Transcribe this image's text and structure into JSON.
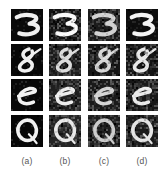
{
  "figure": {
    "kind": "image-grid",
    "rows": 4,
    "columns": 4,
    "background_color": "#ffffff",
    "patch_background_color": "#050505",
    "patch_ink_color": "#f2f2f2",
    "patch_size_px": 32,
    "column_gap_px": 6,
    "row_gap_px": 3
  },
  "columns": [
    {
      "id": "a",
      "label": "(a)"
    },
    {
      "id": "b",
      "label": "(b)"
    },
    {
      "id": "c",
      "label": "(c)"
    },
    {
      "id": "d",
      "label": "(d)"
    }
  ],
  "rows": [
    {
      "id": "row-1",
      "glyph": "3"
    },
    {
      "id": "row-2",
      "glyph": "8"
    },
    {
      "id": "row-3",
      "glyph": "e"
    },
    {
      "id": "row-4",
      "glyph": "Q"
    }
  ],
  "cells": [
    {
      "row": 1,
      "column": "a",
      "glyph": "3",
      "noise": "clean",
      "bg": "#0a0a0a",
      "ink": "#f0f0f0"
    },
    {
      "row": 1,
      "column": "b",
      "glyph": "3",
      "noise": "blocky",
      "bg": "#121212",
      "ink": "#fafafa"
    },
    {
      "row": 1,
      "column": "c",
      "glyph": "3",
      "noise": "speckle",
      "bg": "#1a1a1a",
      "ink": "#e2e2e2"
    },
    {
      "row": 1,
      "column": "d",
      "glyph": "3",
      "noise": "clean",
      "bg": "#0d0d0d",
      "ink": "#f4f4f4"
    },
    {
      "row": 2,
      "column": "a",
      "glyph": "8",
      "noise": "clean",
      "bg": "#080808",
      "ink": "#efefef"
    },
    {
      "row": 2,
      "column": "b",
      "glyph": "8",
      "noise": "blocky",
      "bg": "#1c1c1c",
      "ink": "#dcdcdc"
    },
    {
      "row": 2,
      "column": "c",
      "glyph": "8",
      "noise": "speckle",
      "bg": "#161616",
      "ink": "#e6e6e6"
    },
    {
      "row": 2,
      "column": "d",
      "glyph": "8",
      "noise": "blocky",
      "bg": "#141414",
      "ink": "#e8e8e8"
    },
    {
      "row": 3,
      "column": "a",
      "glyph": "e",
      "noise": "clean",
      "bg": "#080808",
      "ink": "#f2f2f2"
    },
    {
      "row": 3,
      "column": "b",
      "glyph": "e",
      "noise": "blocky",
      "bg": "#1e1e1e",
      "ink": "#ededed"
    },
    {
      "row": 3,
      "column": "c",
      "glyph": "e",
      "noise": "speckle",
      "bg": "#1a1a1a",
      "ink": "#e4e4e4"
    },
    {
      "row": 3,
      "column": "d",
      "glyph": "e",
      "noise": "blocky",
      "bg": "#171717",
      "ink": "#ebebeb"
    },
    {
      "row": 4,
      "column": "a",
      "glyph": "Q",
      "noise": "clean",
      "bg": "#070707",
      "ink": "#f1f1f1"
    },
    {
      "row": 4,
      "column": "b",
      "glyph": "Q",
      "noise": "blocky",
      "bg": "#242424",
      "ink": "#e9e9e9"
    },
    {
      "row": 4,
      "column": "c",
      "glyph": "Q",
      "noise": "speckle",
      "bg": "#1d1d1d",
      "ink": "#dadada"
    },
    {
      "row": 4,
      "column": "d",
      "glyph": "Q",
      "noise": "blocky",
      "bg": "#1b1b1b",
      "ink": "#e5e5e5"
    }
  ]
}
